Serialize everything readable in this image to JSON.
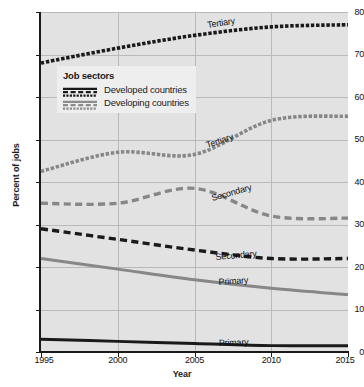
{
  "chart_data": {
    "type": "line",
    "title": "",
    "xlabel": "Year",
    "ylabel": "Percent of jobs",
    "xlim": [
      1995,
      2015
    ],
    "ylim": [
      0,
      80
    ],
    "xticks": [
      "1995",
      "2000",
      "2005",
      "2010",
      "2015"
    ],
    "yticks": [
      "0",
      "10",
      "20",
      "30",
      "40",
      "50",
      "60",
      "70",
      "80"
    ],
    "grid": true,
    "legend_position": "upper-left-inside",
    "x": [
      1995,
      2000,
      2005,
      2010,
      2015
    ],
    "series": [
      {
        "name": "Tertiary",
        "group": "Developed countries",
        "style": "dotted",
        "color": "#1a1a1a",
        "values": [
          68.0,
          71.5,
          74.5,
          76.5,
          77.0
        ]
      },
      {
        "name": "Secondary",
        "group": "Developed countries",
        "style": "dashed",
        "color": "#1a1a1a",
        "values": [
          29.0,
          26.5,
          24.0,
          22.0,
          22.0
        ]
      },
      {
        "name": "Primary",
        "group": "Developed countries",
        "style": "solid",
        "color": "#1a1a1a",
        "values": [
          3.0,
          2.5,
          2.0,
          1.5,
          1.5
        ]
      },
      {
        "name": "Tertiary",
        "group": "Developing countries",
        "style": "dotted",
        "color": "#878787",
        "values": [
          42.5,
          47.0,
          46.5,
          54.5,
          55.5
        ]
      },
      {
        "name": "Secondary",
        "group": "Developing countries",
        "style": "dashed",
        "color": "#878787",
        "values": [
          35.0,
          35.0,
          38.5,
          32.0,
          31.5
        ]
      },
      {
        "name": "Primary",
        "group": "Developing countries",
        "style": "solid",
        "color": "#878787",
        "values": [
          22.0,
          19.5,
          17.0,
          15.0,
          13.5
        ]
      }
    ],
    "annotations": [
      {
        "text": "Tertiary",
        "series": "tertiary-developed"
      },
      {
        "text": "Tertiary",
        "series": "tertiary-developing"
      },
      {
        "text": "Secondary",
        "series": "secondary-developing"
      },
      {
        "text": "Secondary",
        "series": "secondary-developed"
      },
      {
        "text": "Primary",
        "series": "primary-developing"
      },
      {
        "text": "Primary",
        "series": "primary-developed"
      }
    ]
  },
  "legend": {
    "title": "Job sectors",
    "items": [
      {
        "label": "Developed countries",
        "color": "#1a1a1a"
      },
      {
        "label": "Developing countries",
        "color": "#8c8c8c"
      }
    ]
  },
  "axes": {
    "y": {
      "label": "Percent of jobs",
      "ticks": [
        "80",
        "70",
        "60",
        "50",
        "40",
        "30",
        "20",
        "10",
        "0"
      ]
    },
    "x": {
      "label": "Year",
      "ticks": [
        "1995",
        "2000",
        "2005",
        "2010",
        "2015"
      ]
    }
  },
  "colors": {
    "plot_background": "#e2e2e2",
    "page_background": "#ffffff",
    "gridline": "#b9b9b9",
    "axis": "#1a1a1a",
    "developed": "#1a1a1a",
    "developing": "#878787",
    "legend_background": "#eeeeee"
  }
}
